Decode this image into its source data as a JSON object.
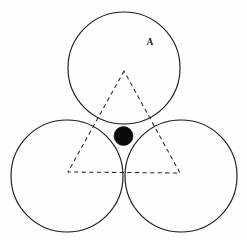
{
  "figure": {
    "name": "three-tangent-circles-with-inscribed-triangle",
    "background_color": "#fefefe",
    "stroke_color": "#1a1a1a",
    "dash_color": "#262626",
    "dot_color": "#0a0a0a",
    "width": 247,
    "height": 240,
    "label": {
      "text": "A",
      "x": 150,
      "y": 45
    },
    "circles": [
      {
        "name": "top-circle",
        "cx": 124,
        "cy": 68,
        "r": 56
      },
      {
        "name": "bottom-left-circle",
        "cx": 67,
        "cy": 176,
        "r": 56
      },
      {
        "name": "bottom-right-circle",
        "cx": 181,
        "cy": 176,
        "r": 56
      }
    ],
    "triangle": {
      "name": "dashed-triangle",
      "points": "124,71 68,172 180,173",
      "dash_pattern": "4.2 3.4"
    },
    "center_dot": {
      "name": "center-dot",
      "cx": 123.5,
      "cy": 136,
      "r": 9.5
    }
  },
  "chart_data": {
    "type": "diagram",
    "title": "",
    "annotations": [
      {
        "label": "A",
        "x": 150,
        "y": 45,
        "refers_to": "top-circle"
      }
    ],
    "shapes": [
      {
        "kind": "circle",
        "name": "top-circle",
        "cx": 124,
        "cy": 68,
        "r": 56,
        "fill": "none",
        "stroke": "#1a1a1a"
      },
      {
        "kind": "circle",
        "name": "bottom-left-circle",
        "cx": 67,
        "cy": 176,
        "r": 56,
        "fill": "none",
        "stroke": "#1a1a1a"
      },
      {
        "kind": "circle",
        "name": "bottom-right-circle",
        "cx": 181,
        "cy": 176,
        "r": 56,
        "fill": "none",
        "stroke": "#1a1a1a"
      },
      {
        "kind": "polygon",
        "name": "dashed-triangle",
        "points": [
          [
            124,
            71
          ],
          [
            68,
            172
          ],
          [
            180,
            173
          ]
        ],
        "fill": "none",
        "stroke": "#262626",
        "dashed": true
      },
      {
        "kind": "circle",
        "name": "center-dot",
        "cx": 123.5,
        "cy": 136,
        "r": 9.5,
        "fill": "#0a0a0a",
        "stroke": "#0a0a0a"
      }
    ],
    "grid": false,
    "legend": false
  }
}
